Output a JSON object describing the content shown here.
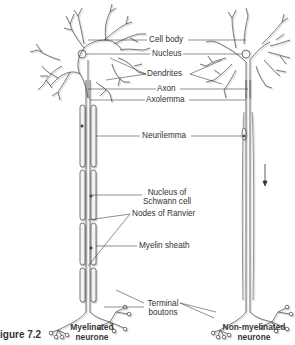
{
  "figure": {
    "label": "igure 7.2",
    "left_caption_line1": "Myelinated",
    "left_caption_line2": "neurone",
    "right_caption_line1": "Non-myelinated",
    "right_caption_line2": "neurone"
  },
  "labels": {
    "cell_body": "Cell body",
    "nucleus": "Nucleus",
    "dendrites": "Dendrites",
    "axon": "Axon",
    "axolemma": "Axolemma",
    "neurilemma": "Neurilemma",
    "nucleus_of_schwann_line1": "Nucleus of",
    "nucleus_of_schwann_line2": "Schwann cell",
    "nodes_of_ranvier": "Nodes of Ranvier",
    "myelin_sheath": "Myelin sheath",
    "terminal_boutons_line1": "Terminal",
    "terminal_boutons_line2": "boutons"
  },
  "colors": {
    "line": "#444444",
    "outline": "#555555",
    "shadow": "#c8c8c8",
    "sheath_fill": "#f3f3f3"
  },
  "indicators": {
    "impulse_direction": "arrow-down"
  }
}
